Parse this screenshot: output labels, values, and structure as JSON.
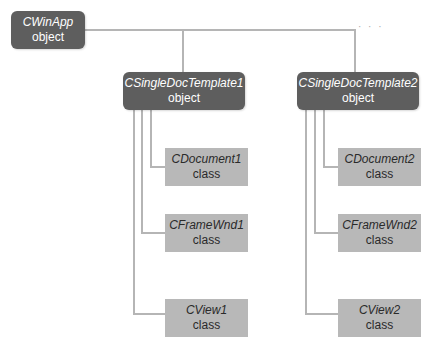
{
  "diagram": {
    "root": {
      "name": "CWinApp",
      "kind": "object"
    },
    "ellipsis": "· · ·",
    "templates": [
      {
        "name": "CSingleDocTemplate1",
        "kind": "object",
        "children": [
          {
            "name": "CDocument1",
            "kind": "class"
          },
          {
            "name": "CFrameWnd1",
            "kind": "class"
          },
          {
            "name": "CView1",
            "kind": "class"
          }
        ]
      },
      {
        "name": "CSingleDocTemplate2",
        "kind": "object",
        "children": [
          {
            "name": "CDocument2",
            "kind": "class"
          },
          {
            "name": "CFrameWnd2",
            "kind": "class"
          },
          {
            "name": "CView2",
            "kind": "class"
          }
        ]
      }
    ],
    "colors": {
      "object_box": "#5e5e5e",
      "class_box": "#b8b8b8",
      "connector": "#b5b5b5"
    }
  }
}
